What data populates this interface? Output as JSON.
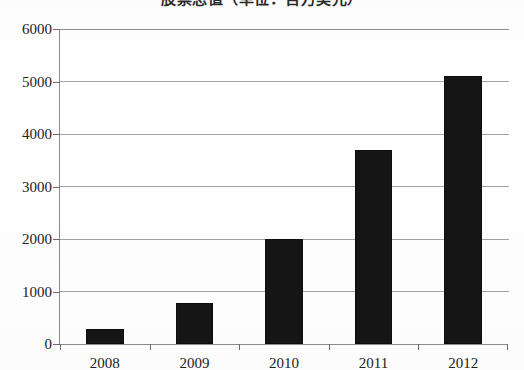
{
  "chart_data": {
    "type": "bar",
    "title": "股票总值（单位：百万美元）",
    "subtitle": "",
    "xlabel": "",
    "ylabel": "",
    "categories": [
      "2008",
      "2009",
      "2010",
      "2011",
      "2012"
    ],
    "values": [
      280,
      780,
      2000,
      3700,
      5100
    ],
    "series": [
      {
        "name": "",
        "values": [
          280,
          780,
          2000,
          3700,
          5100
        ]
      }
    ],
    "ylim": [
      0,
      6000
    ],
    "yticks": [
      0,
      1000,
      2000,
      3000,
      4000,
      5000,
      6000
    ],
    "ytick_labels": [
      "0",
      "1000",
      "2000",
      "3000",
      "4000",
      "5000",
      "6000"
    ],
    "grid": true,
    "grid_axis": "y",
    "legend": false,
    "legend_position": "none",
    "bar_color": "#151515",
    "gridline_color": "#a2a2a2",
    "axis_color": "#8c8c8c",
    "background_color": "#ffffff",
    "bar_width_ratio": 0.42
  }
}
